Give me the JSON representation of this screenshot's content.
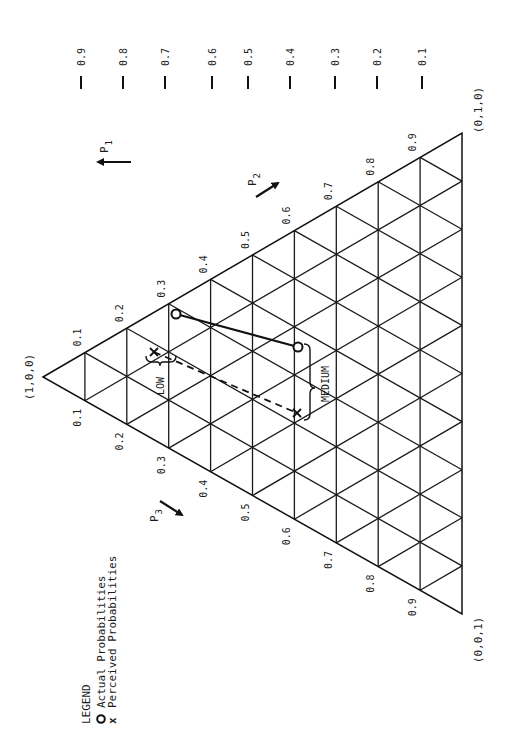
{
  "vertices": {
    "p1_vertex": {
      "label": "(1,0,0)",
      "x": 43,
      "y": 377
    },
    "p2_vertex": {
      "label": "(0,1,0)",
      "x": 462,
      "y": 133
    },
    "p3_vertex": {
      "label": "(0,0,1)",
      "x": 462,
      "y": 614
    }
  },
  "edge_ticks": {
    "p2_edge_labels": [
      "0.1",
      "0.2",
      "0.3",
      "0.4",
      "0.5",
      "0.6",
      "0.7",
      "0.8",
      "0.9"
    ],
    "p3_edge_labels": [
      "0.1",
      "0.2",
      "0.3",
      "0.4",
      "0.5",
      "0.6",
      "0.7",
      "0.8",
      "0.9"
    ]
  },
  "p1_scale": {
    "ticks": [
      {
        "label": "0.9",
        "x": 81
      },
      {
        "label": "0.8",
        "x": 123
      },
      {
        "label": "0.7",
        "x": 165
      },
      {
        "label": "0.6",
        "x": 212
      },
      {
        "label": "0.5",
        "x": 248
      },
      {
        "label": "0.4",
        "x": 290
      },
      {
        "label": "0.3",
        "x": 335
      },
      {
        "label": "0.2",
        "x": 377
      },
      {
        "label": "0.1",
        "x": 422
      }
    ]
  },
  "axes": {
    "p1": {
      "label": "P",
      "sub": "1"
    },
    "p2": {
      "label": "P",
      "sub": "2"
    },
    "p3": {
      "label": "P",
      "sub": "3"
    }
  },
  "series": {
    "actual": {
      "name": "Actual Probabilities",
      "marker": "O",
      "line": "solid",
      "points": [
        {
          "x": 176,
          "y": 314
        },
        {
          "x": 298,
          "y": 347
        }
      ]
    },
    "perceived": {
      "name": "Perceived Probabilities",
      "marker": "x",
      "line": "dashed",
      "points": [
        {
          "x": 154,
          "y": 352
        },
        {
          "x": 297,
          "y": 413
        }
      ]
    }
  },
  "annotations": {
    "low": "LOW",
    "medium": "MEDIUM"
  },
  "legend": {
    "title": "LEGEND",
    "items": [
      {
        "symbol": "O",
        "label": "Actual Probabilities"
      },
      {
        "symbol": "x",
        "label": "Perceived Probabilities"
      }
    ]
  }
}
